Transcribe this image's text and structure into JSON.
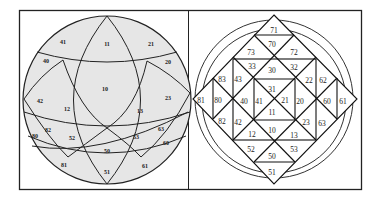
{
  "figure": {
    "frame": {
      "x": 19,
      "y": 10,
      "width": 343,
      "height": 180,
      "divider_x": 188
    },
    "colors": {
      "sphere_fill": "#e6e6e6",
      "line": "#222222",
      "background": "#ffffff"
    },
    "left_panel": {
      "type": "sphere-projection",
      "labels": [
        {
          "id": "11",
          "x": 107,
          "y": 44
        },
        {
          "id": "41",
          "x": 63,
          "y": 42
        },
        {
          "id": "21",
          "x": 151,
          "y": 44
        },
        {
          "id": "40",
          "x": 46,
          "y": 61
        },
        {
          "id": "20",
          "x": 168,
          "y": 62
        },
        {
          "id": "10",
          "x": 105,
          "y": 89
        },
        {
          "id": "42",
          "x": 40,
          "y": 101
        },
        {
          "id": "23",
          "x": 168,
          "y": 98
        },
        {
          "id": "12",
          "x": 67,
          "y": 109
        },
        {
          "id": "13",
          "x": 140,
          "y": 111
        },
        {
          "id": "82",
          "x": 48,
          "y": 130
        },
        {
          "id": "63",
          "x": 161,
          "y": 129
        },
        {
          "id": "80",
          "x": 35,
          "y": 136
        },
        {
          "id": "52",
          "x": 72,
          "y": 138
        },
        {
          "id": "53",
          "x": 136,
          "y": 137
        },
        {
          "id": "60",
          "x": 166,
          "y": 143
        },
        {
          "id": "50",
          "x": 107,
          "y": 151
        },
        {
          "id": "81",
          "x": 64,
          "y": 165
        },
        {
          "id": "61",
          "x": 145,
          "y": 166
        },
        {
          "id": "51",
          "x": 107,
          "y": 172
        }
      ]
    },
    "right_panel": {
      "type": "diamond-grid",
      "labels": [
        {
          "id": "71",
          "x": 274,
          "y": 31
        },
        {
          "id": "70",
          "x": 272,
          "y": 45
        },
        {
          "id": "73",
          "x": 251,
          "y": 53
        },
        {
          "id": "72",
          "x": 294,
          "y": 53
        },
        {
          "id": "33",
          "x": 252,
          "y": 67
        },
        {
          "id": "30",
          "x": 272,
          "y": 71
        },
        {
          "id": "32",
          "x": 294,
          "y": 68
        },
        {
          "id": "83",
          "x": 222,
          "y": 80
        },
        {
          "id": "43",
          "x": 238,
          "y": 80
        },
        {
          "id": "22",
          "x": 309,
          "y": 81
        },
        {
          "id": "62",
          "x": 323,
          "y": 81
        },
        {
          "id": "31",
          "x": 272,
          "y": 90
        },
        {
          "id": "81",
          "x": 201,
          "y": 101
        },
        {
          "id": "80",
          "x": 218,
          "y": 101
        },
        {
          "id": "40",
          "x": 244,
          "y": 102
        },
        {
          "id": "41",
          "x": 259,
          "y": 102
        },
        {
          "id": "21",
          "x": 285,
          "y": 101
        },
        {
          "id": "20",
          "x": 300,
          "y": 102
        },
        {
          "id": "60",
          "x": 327,
          "y": 102
        },
        {
          "id": "61",
          "x": 343,
          "y": 102
        },
        {
          "id": "11",
          "x": 272,
          "y": 113
        },
        {
          "id": "82",
          "x": 222,
          "y": 122
        },
        {
          "id": "42",
          "x": 238,
          "y": 123
        },
        {
          "id": "23",
          "x": 306,
          "y": 123
        },
        {
          "id": "63",
          "x": 322,
          "y": 124
        },
        {
          "id": "12",
          "x": 252,
          "y": 135
        },
        {
          "id": "10",
          "x": 272,
          "y": 131
        },
        {
          "id": "13",
          "x": 294,
          "y": 136
        },
        {
          "id": "52",
          "x": 251,
          "y": 150
        },
        {
          "id": "50",
          "x": 272,
          "y": 157
        },
        {
          "id": "53",
          "x": 294,
          "y": 150
        },
        {
          "id": "51",
          "x": 272,
          "y": 173
        }
      ]
    }
  }
}
